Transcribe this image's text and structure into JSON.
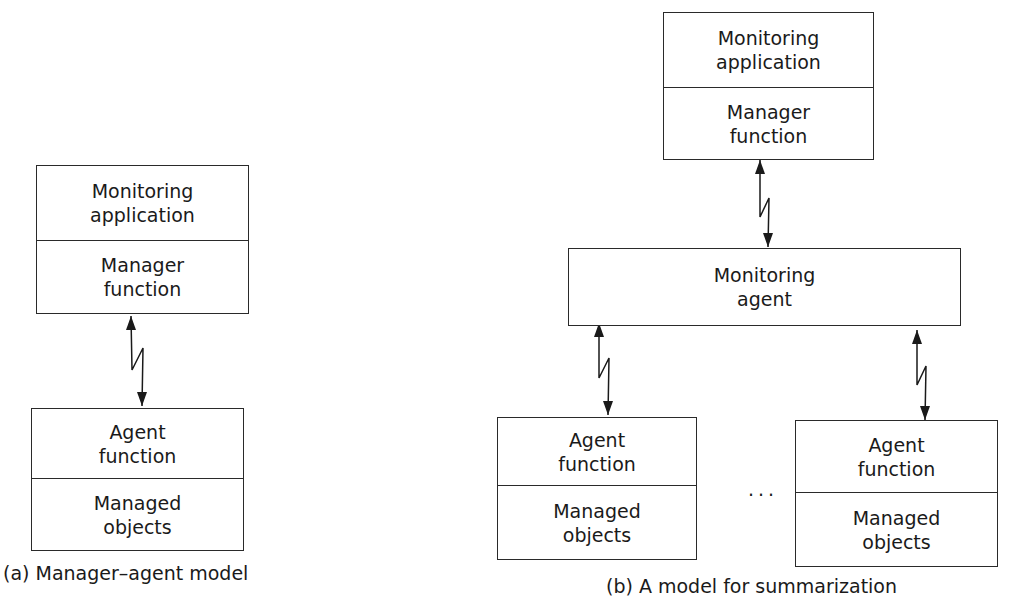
{
  "diagram_a": {
    "caption": "(a) Manager–agent model",
    "manager_stack": {
      "top": "Monitoring\napplication",
      "bottom": "Manager\nfunction"
    },
    "agent_stack": {
      "top": "Agent\nfunction",
      "bottom": "Managed\nobjects"
    },
    "link": "bidirectional-zigzag-arrow"
  },
  "diagram_b": {
    "caption": "(b) A model for summarization",
    "manager_stack": {
      "top": "Monitoring\napplication",
      "bottom": "Manager\nfunction"
    },
    "monitoring_agent": "Monitoring\nagent",
    "agents": [
      {
        "top": "Agent\nfunction",
        "bottom": "Managed\nobjects"
      },
      {
        "top": "Agent\nfunction",
        "bottom": "Managed\nobjects"
      }
    ],
    "ellipsis": "..."
  },
  "colors": {
    "line": "#2a2a2a",
    "text": "#1a1a1a",
    "background": "#ffffff"
  }
}
